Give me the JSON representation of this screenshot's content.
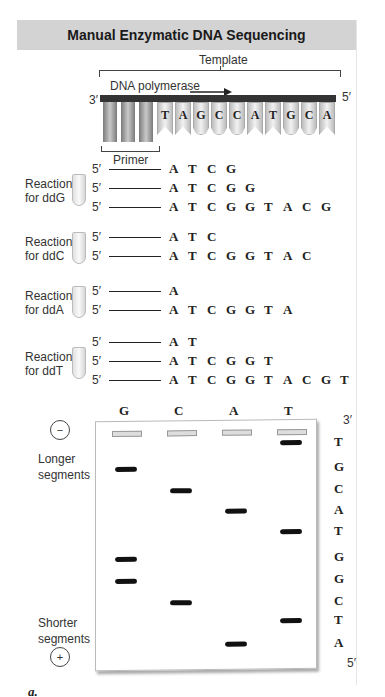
{
  "header": {
    "title": "Manual Enzymatic DNA Sequencing"
  },
  "template_diagram": {
    "template_label": "Template",
    "polymerase_label": "DNA polymerase",
    "arrow_icon": "right-arrow-icon",
    "end_3": "3′",
    "end_5": "5′",
    "primer_label": "Primer",
    "primer_columns": 3,
    "template_bases": [
      "T",
      "A",
      "G",
      "C",
      "C",
      "A",
      "T",
      "G",
      "C",
      "A"
    ]
  },
  "reactions": [
    {
      "label_line1": "Reaction",
      "label_line2": "for ddG",
      "strands": [
        {
          "prime": "5′",
          "seq": [
            "A",
            "T",
            "C",
            "G"
          ]
        },
        {
          "prime": "5′",
          "seq": [
            "A",
            "T",
            "C",
            "G",
            "G"
          ]
        },
        {
          "prime": "5′",
          "seq": [
            "A",
            "T",
            "C",
            "G",
            "G",
            "T",
            "A",
            "C",
            "G"
          ]
        }
      ]
    },
    {
      "label_line1": "Reaction",
      "label_line2": "for ddC",
      "strands": [
        {
          "prime": "5′",
          "seq": [
            "A",
            "T",
            "C"
          ]
        },
        {
          "prime": "5′",
          "seq": [
            "A",
            "T",
            "C",
            "G",
            "G",
            "T",
            "A",
            "C"
          ]
        }
      ]
    },
    {
      "label_line1": "Reaction",
      "label_line2": "for ddA",
      "strands": [
        {
          "prime": "5′",
          "seq": [
            "A"
          ]
        },
        {
          "prime": "5′",
          "seq": [
            "A",
            "T",
            "C",
            "G",
            "G",
            "T",
            "A"
          ]
        }
      ]
    },
    {
      "label_line1": "Reaction",
      "label_line2": "for ddT",
      "strands": [
        {
          "prime": "5′",
          "seq": [
            "A",
            "T"
          ]
        },
        {
          "prime": "5′",
          "seq": [
            "A",
            "T",
            "C",
            "G",
            "G",
            "T"
          ]
        },
        {
          "prime": "5′",
          "seq": [
            "A",
            "T",
            "C",
            "G",
            "G",
            "T",
            "A",
            "C",
            "G",
            "T"
          ]
        }
      ]
    }
  ],
  "gel": {
    "lanes": [
      "G",
      "C",
      "A",
      "T"
    ],
    "negative_symbol": "−",
    "positive_symbol": "+",
    "longer_label_1": "Longer",
    "longer_label_2": "segments",
    "shorter_label_1": "Shorter",
    "shorter_label_2": "segments",
    "end_top": "3′",
    "end_bottom": "5′",
    "read_sequence_top_to_bottom": [
      "T",
      "G",
      "C",
      "A",
      "T",
      "G",
      "G",
      "C",
      "T",
      "A"
    ],
    "bands": [
      {
        "lane": "T",
        "row": 0
      },
      {
        "lane": "G",
        "row": 1
      },
      {
        "lane": "C",
        "row": 2
      },
      {
        "lane": "A",
        "row": 3
      },
      {
        "lane": "T",
        "row": 4
      },
      {
        "lane": "G",
        "row": 5
      },
      {
        "lane": "G",
        "row": 6
      },
      {
        "lane": "C",
        "row": 7
      },
      {
        "lane": "T",
        "row": 8
      },
      {
        "lane": "A",
        "row": 9
      }
    ]
  },
  "caption": "a."
}
